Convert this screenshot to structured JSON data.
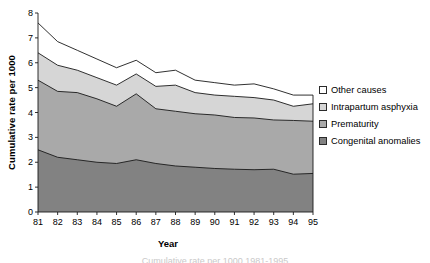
{
  "chart_data": {
    "type": "area",
    "title": "",
    "subtitle": "",
    "xlabel": "Year",
    "ylabel": "Cumulative rate per 1000",
    "stacked": true,
    "grid": false,
    "legend_position": "right",
    "xlim": [
      81,
      95
    ],
    "ylim": [
      0,
      8
    ],
    "ytick_labels": [
      "0",
      "1",
      "2",
      "3",
      "4",
      "5",
      "6",
      "7",
      "8"
    ],
    "yticks": [
      0,
      1,
      2,
      3,
      4,
      5,
      6,
      7,
      8
    ],
    "categories": [
      "81",
      "82",
      "83",
      "84",
      "85",
      "86",
      "87",
      "88",
      "89",
      "90",
      "91",
      "92",
      "93",
      "94",
      "95"
    ],
    "x": [
      81,
      82,
      83,
      84,
      85,
      86,
      87,
      88,
      89,
      90,
      91,
      92,
      93,
      94,
      95
    ],
    "series": [
      {
        "name": "Congenital anomalies",
        "color": "#828282",
        "stack_order": 1,
        "values": [
          2.5,
          2.2,
          2.1,
          2.0,
          1.95,
          2.1,
          1.95,
          1.85,
          1.8,
          1.75,
          1.72,
          1.7,
          1.72,
          1.52,
          1.55
        ],
        "cumulative": [
          2.5,
          2.2,
          2.1,
          2.0,
          1.95,
          2.1,
          1.95,
          1.85,
          1.8,
          1.75,
          1.72,
          1.7,
          1.72,
          1.52,
          1.55
        ]
      },
      {
        "name": "Prematurity",
        "color": "#a9a9a9",
        "stack_order": 2,
        "values": [
          2.8,
          2.65,
          2.7,
          2.55,
          2.3,
          2.65,
          2.2,
          2.2,
          2.15,
          2.15,
          2.08,
          2.08,
          1.98,
          2.16,
          2.1
        ],
        "cumulative": [
          5.3,
          4.85,
          4.8,
          4.55,
          4.25,
          4.75,
          4.15,
          4.05,
          3.95,
          3.9,
          3.8,
          3.78,
          3.7,
          3.68,
          3.65
        ]
      },
      {
        "name": "Intrapartum asphyxia",
        "color": "#d6d6d6",
        "stack_order": 3,
        "values": [
          1.1,
          1.05,
          0.9,
          0.85,
          0.85,
          0.8,
          0.9,
          1.05,
          0.85,
          0.8,
          0.85,
          0.82,
          0.8,
          0.57,
          0.7
        ],
        "cumulative": [
          6.4,
          5.9,
          5.7,
          5.4,
          5.1,
          5.55,
          5.05,
          5.1,
          4.8,
          4.7,
          4.65,
          4.6,
          4.5,
          4.25,
          4.35
        ]
      },
      {
        "name": "Other causes",
        "color": "#ffffff",
        "stack_order": 4,
        "values": [
          1.2,
          0.95,
          0.8,
          0.75,
          0.7,
          0.55,
          0.55,
          0.6,
          0.5,
          0.5,
          0.45,
          0.55,
          0.45,
          0.45,
          0.35
        ],
        "cumulative": [
          7.6,
          6.85,
          6.5,
          6.15,
          5.8,
          6.1,
          5.6,
          5.7,
          5.3,
          5.2,
          5.1,
          5.15,
          4.95,
          4.7,
          4.7
        ]
      }
    ]
  },
  "axes": {
    "y_title": "Cumulative rate per 1000",
    "x_title": "Year"
  },
  "legend": {
    "items": [
      {
        "label": "Other causes",
        "color": "#ffffff"
      },
      {
        "label": "Intrapartum asphyxia",
        "color": "#d6d6d6"
      },
      {
        "label": "Prematurity",
        "color": "#a9a9a9"
      },
      {
        "label": "Congenital anomalies",
        "color": "#828282"
      }
    ]
  },
  "caption": {
    "text": "Cumulative rate per 1000 1981-1995"
  }
}
